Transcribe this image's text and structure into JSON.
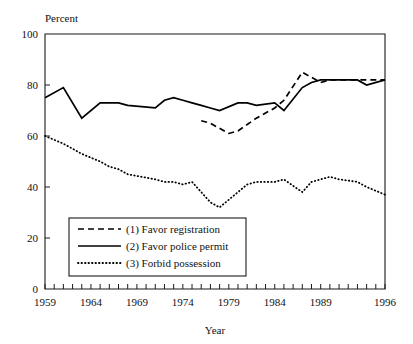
{
  "chart_data": {
    "type": "line",
    "title": "",
    "xlabel": "Year",
    "ylabel": "Percent",
    "ylabel_position": "above-axis",
    "xlim": [
      1959,
      1996
    ],
    "ylim": [
      0,
      100
    ],
    "grid": false,
    "y_ticks": [
      0,
      20,
      40,
      60,
      80,
      100
    ],
    "y_tick_labels": [
      "0",
      "20",
      "40",
      "60",
      "80",
      "100"
    ],
    "x_tick_labels": [
      "1959",
      "1964",
      "1969",
      "1974",
      "1979",
      "1984",
      "1989",
      "1996"
    ],
    "x_tick_values": [
      1959,
      1964,
      1969,
      1974,
      1979,
      1984,
      1989,
      1996
    ],
    "x_minor_tick_interval": 1,
    "legend_position": "lower-left-inside",
    "series": [
      {
        "name": "(1) Favor registration",
        "style": "dashed",
        "color": "#000000",
        "x": [
          1976,
          1977,
          1978,
          1979,
          1980,
          1982,
          1984,
          1985,
          1987,
          1988,
          1989,
          1990,
          1991,
          1993,
          1994,
          1996
        ],
        "values": [
          66,
          65,
          63,
          61,
          62,
          67,
          71,
          74,
          85,
          83,
          81,
          82,
          82,
          82,
          82,
          82
        ]
      },
      {
        "name": "(2) Favor police permit",
        "style": "solid",
        "color": "#000000",
        "x": [
          1959,
          1961,
          1963,
          1965,
          1966,
          1967,
          1968,
          1971,
          1972,
          1973,
          1974,
          1975,
          1976,
          1977,
          1978,
          1980,
          1981,
          1982,
          1984,
          1985,
          1987,
          1988,
          1989,
          1990,
          1991,
          1993,
          1994,
          1996
        ],
        "values": [
          75,
          79,
          67,
          73,
          73,
          73,
          72,
          71,
          74,
          75,
          74,
          73,
          72,
          71,
          70,
          73,
          73,
          72,
          73,
          70,
          79,
          81,
          82,
          82,
          82,
          82,
          80,
          82
        ]
      },
      {
        "name": "(3) Forbid possession",
        "style": "dotted",
        "color": "#000000",
        "x": [
          1959,
          1961,
          1963,
          1965,
          1966,
          1967,
          1968,
          1971,
          1972,
          1973,
          1974,
          1975,
          1976,
          1977,
          1978,
          1980,
          1981,
          1982,
          1984,
          1985,
          1987,
          1988,
          1989,
          1990,
          1991,
          1993,
          1994,
          1996
        ],
        "values": [
          60,
          57,
          53,
          50,
          48,
          47,
          45,
          43,
          42,
          42,
          41,
          42,
          38,
          34,
          32,
          38,
          41,
          42,
          42,
          43,
          38,
          42,
          43,
          44,
          43,
          42,
          40,
          37
        ]
      }
    ]
  },
  "axis": {
    "y_title": "Percent",
    "x_title": "Year"
  },
  "legend": {
    "entries": [
      {
        "label": "(1) Favor registration",
        "style": "dashed"
      },
      {
        "label": "(2) Favor police permit",
        "style": "solid"
      },
      {
        "label": "(3) Forbid possession",
        "style": "dotted"
      }
    ]
  }
}
